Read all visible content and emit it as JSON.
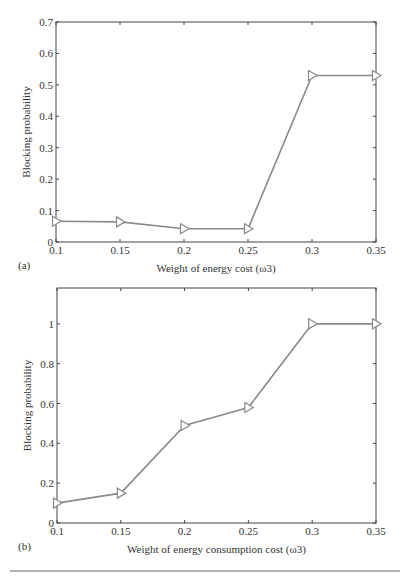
{
  "chart_data": [
    {
      "type": "line",
      "panel_label": "(a)",
      "title": "",
      "xlabel": "Weight of energy cost (ω3)",
      "ylabel": "Blocking probability",
      "x": [
        0.1,
        0.15,
        0.2,
        0.25,
        0.3,
        0.35
      ],
      "series": [
        {
          "name": "Blocking probability",
          "marker": "triangle-right",
          "values": [
            0.066,
            0.064,
            0.042,
            0.042,
            0.53,
            0.53
          ]
        }
      ],
      "xticks": [
        "0.1",
        "0.15",
        "0.2",
        "0.25",
        "0.3",
        "0.35"
      ],
      "yticks": [
        "0",
        "0.1",
        "0.2",
        "0.3",
        "0.4",
        "0.5",
        "0.6",
        "0.7"
      ],
      "xlim": [
        0.1,
        0.35
      ],
      "ylim": [
        0,
        0.7
      ],
      "grid": false,
      "legend": "none"
    },
    {
      "type": "line",
      "panel_label": "(b)",
      "title": "",
      "xlabel": "Weight of energy consumption cost (ω3)",
      "ylabel": "Blocking probability",
      "x": [
        0.1,
        0.15,
        0.2,
        0.25,
        0.3,
        0.35
      ],
      "series": [
        {
          "name": "Blocking probability",
          "marker": "triangle-right",
          "values": [
            0.1,
            0.15,
            0.49,
            0.58,
            1.0,
            1.0
          ]
        }
      ],
      "xticks": [
        "0.1",
        "0.15",
        "0.2",
        "0.25",
        "0.3",
        "0.35"
      ],
      "yticks": [
        "0",
        "0.2",
        "0.4",
        "0.6",
        "0.8",
        "1"
      ],
      "xlim": [
        0.1,
        0.35
      ],
      "ylim": [
        0,
        1.18
      ],
      "grid": false,
      "legend": "none"
    }
  ],
  "colors": {
    "line": "#8a8a8a",
    "marker": "#8a8a8a",
    "axis": "#444444"
  }
}
